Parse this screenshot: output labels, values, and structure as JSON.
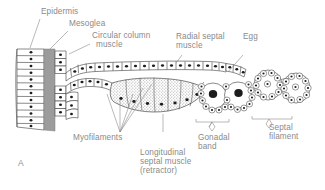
{
  "figure": {
    "panel_label": "A",
    "text_color": "#8a8a8a",
    "ink_color": "#4a4a4a",
    "mesoglea_color": "#9c9c9c",
    "nucleus_color": "#1c1c1c",
    "background": "#ffffff"
  },
  "labels": {
    "epidermis": "Epidermis",
    "mesoglea": "Mesoglea",
    "circular_column_muscle_l1": "Circular column",
    "circular_column_muscle_l2": "muscle",
    "radial_septal_muscle_l1": "Radial septal",
    "radial_septal_muscle_l2": "muscle",
    "egg": "Egg",
    "myofilaments": "Myofilaments",
    "longitudinal_septal_muscle_l1": "Longitudinal",
    "longitudinal_septal_muscle_l2": "septal muscle",
    "longitudinal_septal_muscle_l3": "(retractor)",
    "gonadal_band_l1": "Gonadal",
    "gonadal_band_l2": "band",
    "septal_filament_l1": "Septal",
    "septal_filament_l2": "filament"
  }
}
